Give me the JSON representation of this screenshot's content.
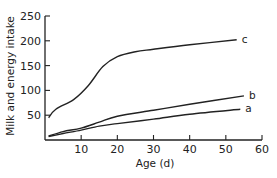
{
  "chart_data": {
    "type": "line",
    "title": "",
    "xlabel": "Age (d)",
    "ylabel": "Milk and energy intake",
    "xlim": [
      0,
      60
    ],
    "ylim": [
      0,
      250
    ],
    "xticks": [
      10,
      20,
      30,
      40,
      50,
      60
    ],
    "yticks": [
      50,
      100,
      150,
      200,
      250
    ],
    "grid": false,
    "legend": "inline labels at line ends",
    "series": [
      {
        "name": "a",
        "x": [
          1,
          5,
          10,
          15,
          20,
          30,
          40,
          54
        ],
        "values": [
          7,
          13,
          20,
          28,
          33,
          42,
          52,
          62
        ]
      },
      {
        "name": "b",
        "x": [
          1,
          5,
          10,
          15,
          20,
          30,
          40,
          55
        ],
        "values": [
          8,
          17,
          24,
          36,
          48,
          60,
          72,
          89
        ]
      },
      {
        "name": "c",
        "x": [
          1,
          3,
          8,
          12,
          16,
          20,
          25,
          30,
          40,
          53
        ],
        "values": [
          45,
          62,
          82,
          110,
          148,
          168,
          178,
          183,
          192,
          202
        ]
      }
    ]
  },
  "colors": {
    "line": "#222222",
    "text": "#222222"
  }
}
